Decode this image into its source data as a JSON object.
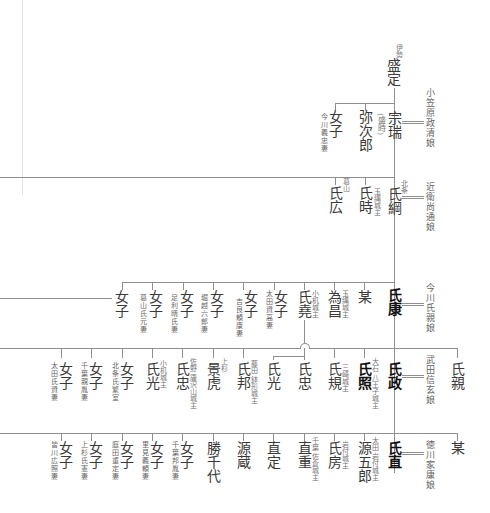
{
  "generations": [
    {
      "id": "gen0",
      "head": {
        "name": "盛定",
        "note": "伊勢"
      }
    },
    {
      "id": "gen1",
      "head": {
        "name": "宗瑞",
        "note": "(盛時)",
        "spouse": "小笠原政清娘"
      },
      "siblings": [
        {
          "name": "弥次郎",
          "note": ""
        },
        {
          "name": "女子",
          "note": "今川義忠妻"
        }
      ]
    },
    {
      "id": "gen2",
      "head": {
        "name": "氏綱",
        "note": "北条",
        "spouse": "近衛尚通娘"
      },
      "siblings": [
        {
          "name": "氏時",
          "note": "玉縄城主"
        },
        {
          "name": "氏広",
          "note": "葛山"
        }
      ]
    },
    {
      "id": "gen3",
      "head": {
        "name": "氏康",
        "note": "",
        "spouse": "今川氏親娘"
      },
      "siblings": [
        {
          "name": "某",
          "note": ""
        },
        {
          "name": "為昌",
          "note": "玉縄城主"
        },
        {
          "name": "氏堯",
          "note": "小机城主"
        },
        {
          "name": "女子",
          "note": "太田資高妻"
        },
        {
          "name": "女子",
          "note": "吉良頼康妻"
        },
        {
          "name": "女子",
          "note": "堀越六郎妻"
        },
        {
          "name": "女子",
          "note": "足利晴氏妻"
        },
        {
          "name": "女子",
          "note": "葛山氏元妻"
        },
        {
          "name": "女子",
          "note": ""
        }
      ]
    },
    {
      "id": "gen4",
      "head": {
        "name": "氏政",
        "note": "",
        "spouse": "武田信玄娘"
      },
      "siblings": [
        {
          "name": "氏親",
          "note": ""
        },
        {
          "name": "氏照",
          "note": "大石 八王子城主"
        },
        {
          "name": "氏規",
          "note": "三崎城主"
        },
        {
          "name": "氏忠",
          "note": ""
        },
        {
          "name": "氏光",
          "note": ""
        },
        {
          "name": "氏邦",
          "note": "藤田 鉢形城主"
        },
        {
          "name": "景虎",
          "note": "上杉"
        },
        {
          "name": "氏忠",
          "note": "佐野 唐沢山城主"
        },
        {
          "name": "氏光",
          "note": "小机城主"
        },
        {
          "name": "女子",
          "note": "北条氏繁室"
        },
        {
          "name": "女子",
          "note": "千葉親胤妻"
        },
        {
          "name": "女子",
          "note": "太田氏資妻"
        }
      ]
    },
    {
      "id": "gen5",
      "head": {
        "name": "氏直",
        "note": "",
        "spouse": "徳川家康娘"
      },
      "siblings": [
        {
          "name": "某",
          "note": ""
        },
        {
          "name": "源五郎",
          "note": "太田 岩付城主"
        },
        {
          "name": "氏房",
          "note": "岩付城主"
        },
        {
          "name": "直重",
          "note": "千葉 佐倉城主"
        },
        {
          "name": "直定",
          "note": ""
        },
        {
          "name": "源蔵",
          "note": ""
        },
        {
          "name": "勝千代",
          "note": ""
        },
        {
          "name": "女子",
          "note": "千葉邦胤妻"
        },
        {
          "name": "女子",
          "note": "里見義頼妻"
        },
        {
          "name": "女子",
          "note": "庭田重定妻"
        },
        {
          "name": "女子",
          "note": "上杉氏憲妻"
        },
        {
          "name": "女子",
          "note": "皆川広照妻"
        }
      ]
    }
  ],
  "colors": {
    "line": "#8f8f8f",
    "name": "#3a3a3a",
    "head": "#111111",
    "note": "#777777"
  }
}
